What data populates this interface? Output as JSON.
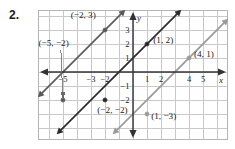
{
  "exercise": {
    "number": "2."
  },
  "chart_data": {
    "type": "line",
    "title": "",
    "xlabel": "x",
    "ylabel": "y",
    "grid": true,
    "legend": "none",
    "xlim": [
      -6.8,
      6.8
    ],
    "ylim": [
      -4.45,
      4.45
    ],
    "x_ticks_visible": [
      -5,
      -3,
      -2,
      1,
      2,
      4,
      5
    ],
    "y_ticks_visible": [
      3,
      2,
      1,
      -1,
      -2
    ],
    "series": [
      {
        "name": "left-line",
        "color": "#5a5a5a",
        "slope": 1,
        "intercept": 5,
        "points": [
          {
            "label": "(−2, 3)",
            "x": -2,
            "y": 3
          },
          {
            "label": "(−5, −2)",
            "x": -5,
            "y": -2
          }
        ]
      },
      {
        "name": "middle-line",
        "color": "#2b2b2b",
        "slope": 1,
        "intercept": 1,
        "points": [
          {
            "label": "(1, 2)",
            "x": 1,
            "y": 2
          },
          {
            "label": "(−2, −2)",
            "x": -2,
            "y": -2
          }
        ]
      },
      {
        "name": "right-line",
        "color": "#9a9a9a",
        "slope": 1,
        "intercept": -3,
        "points": [
          {
            "label": "(4, 1)",
            "x": 4,
            "y": 1
          },
          {
            "label": "(1, −3)",
            "x": 1,
            "y": -3
          }
        ]
      }
    ],
    "annotations": [
      {
        "name": "label-neg2-3",
        "text": "(−2, 3)",
        "x": -4.45,
        "y": 3.85
      },
      {
        "name": "label-neg5-neg2",
        "text": "(−5, −2)",
        "x": -6.75,
        "y": 1.85
      },
      {
        "name": "label-1-2",
        "text": "(1, 2)",
        "x": 1.45,
        "y": 2.05
      },
      {
        "name": "label-4-1",
        "text": "(4, 1)",
        "x": 4.35,
        "y": 1.05
      },
      {
        "name": "label-neg2-neg2",
        "text": "(−2, −2)",
        "x": -2.55,
        "y": -2.95
      },
      {
        "name": "label-1-neg3",
        "text": "(1, −3)",
        "x": 1.3,
        "y": -3.35
      }
    ],
    "axis_tick_labels": {
      "x": [
        {
          "value": -5,
          "text": "−5"
        },
        {
          "value": -3,
          "text": "−3"
        },
        {
          "value": -2,
          "text": "−2"
        },
        {
          "value": 1,
          "text": "1"
        },
        {
          "value": 2,
          "text": "2"
        },
        {
          "value": 4,
          "text": "4"
        },
        {
          "value": 5,
          "text": "5"
        }
      ],
      "y": [
        {
          "value": 3,
          "text": "3"
        },
        {
          "value": 2,
          "text": "2"
        },
        {
          "value": 1,
          "text": "1"
        },
        {
          "value": -1,
          "text": "−1"
        },
        {
          "value": -2,
          "text": "−2"
        }
      ]
    },
    "colors": {
      "grid": "#c9c9c9",
      "axis": "#333333",
      "border": "#b5b5b5",
      "background": "#ffffff",
      "text": "#222222"
    }
  }
}
